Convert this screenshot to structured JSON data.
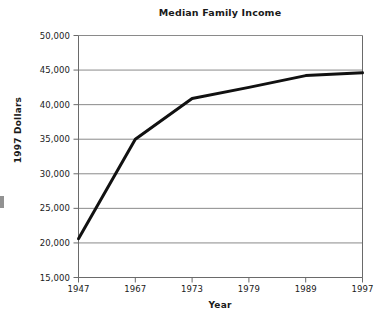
{
  "chart_data": {
    "type": "line",
    "title": "Median Family Income",
    "xlabel": "Year",
    "ylabel": "1997 Dollars",
    "categories": [
      "1947",
      "1967",
      "1973",
      "1979",
      "1989",
      "1997"
    ],
    "values": [
      20600,
      35000,
      40900,
      42500,
      44200,
      44600
    ],
    "series": [
      {
        "name": "Median Family Income",
        "values": [
          20600,
          35000,
          40900,
          42500,
          44200,
          44600
        ]
      }
    ],
    "ylim": [
      15000,
      50000
    ],
    "ytick_values": [
      15000,
      20000,
      25000,
      30000,
      35000,
      40000,
      45000,
      50000
    ],
    "ytick_labels": [
      "15,000",
      "20,000",
      "25,000",
      "30,000",
      "35,000",
      "40,000",
      "45,000",
      "50,000"
    ],
    "xtick_labels": [
      "1947",
      "1967",
      "1973",
      "1979",
      "1989",
      "1997"
    ],
    "grid": true,
    "grid_axis": "horizontal",
    "legend": false,
    "legend_position": "none",
    "line_color": "#111111",
    "grid_color": "#8a8a8a",
    "axis_color": "#6a6a6a",
    "background_color": "#ffffff"
  }
}
